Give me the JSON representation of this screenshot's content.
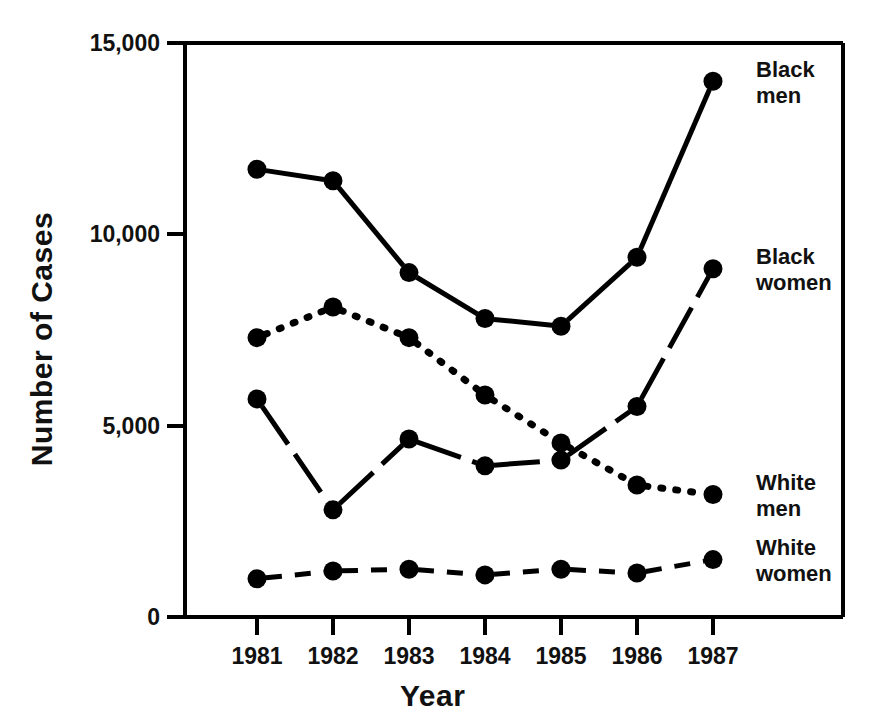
{
  "chart_data": {
    "type": "line",
    "title": "",
    "xlabel": "Year",
    "ylabel": "Number of Cases",
    "categories": [
      "1981",
      "1982",
      "1983",
      "1984",
      "1985",
      "1986",
      "1987"
    ],
    "x": [
      1981,
      1982,
      1983,
      1984,
      1985,
      1986,
      1987
    ],
    "xlim": [
      1980.6,
      1987.4
    ],
    "ylim": [
      0,
      15000
    ],
    "y_ticks": [
      0,
      5000,
      10000,
      15000
    ],
    "y_tick_labels": [
      "0",
      "5,000",
      "10,000",
      "15,000"
    ],
    "x_ticks": [
      1981,
      1982,
      1983,
      1984,
      1985,
      1986,
      1987
    ],
    "grid": false,
    "legend_position": "right-inline-labels",
    "series": [
      {
        "name": "Black men",
        "label_lines": "Black\nmen",
        "line_style": "solid",
        "marker": "filled-circle",
        "color": "#000000",
        "values": [
          11700,
          11400,
          9000,
          7800,
          7600,
          9400,
          14000
        ]
      },
      {
        "name": "Black women",
        "label_lines": "Black\nwomen",
        "line_style": "solid-with-gaps",
        "marker": "filled-circle",
        "color": "#000000",
        "values": [
          5700,
          2800,
          4650,
          3950,
          4100,
          5500,
          9100
        ]
      },
      {
        "name": "White men",
        "label_lines": "White\nmen",
        "line_style": "dotted",
        "marker": "filled-circle",
        "color": "#000000",
        "values": [
          7300,
          8100,
          7300,
          5800,
          4550,
          3450,
          3200
        ]
      },
      {
        "name": "White women",
        "label_lines": "White\nwomen",
        "line_style": "dashed",
        "marker": "filled-circle",
        "color": "#000000",
        "values": [
          1000,
          1200,
          1250,
          1100,
          1250,
          1150,
          1500
        ]
      }
    ],
    "annotations": []
  },
  "axes": {
    "y_title": "Number of Cases",
    "x_title": "Year",
    "y_tick_labels": [
      "15,000",
      "10,000",
      "5,000",
      "0"
    ],
    "x_tick_labels": [
      "1981",
      "1982",
      "1983",
      "1984",
      "1985",
      "1986",
      "1987"
    ]
  },
  "labels": {
    "black_men": "Black\nmen",
    "black_women": "Black\nwomen",
    "white_men": "White\nmen",
    "white_women": "White\nwomen"
  },
  "style": {
    "ink": "#000000",
    "background": "#ffffff"
  }
}
